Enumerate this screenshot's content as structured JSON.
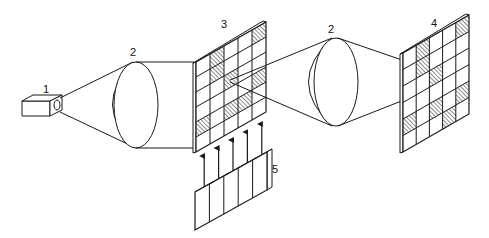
{
  "diagram": {
    "type": "optical-system-schematic",
    "stroke_color": "#1a1a1a",
    "hatch_color": "#1a1a1a",
    "background": "#ffffff",
    "components": [
      {
        "id": "1",
        "label": "1",
        "kind": "light-source"
      },
      {
        "id": "2a",
        "label": "2",
        "kind": "lens"
      },
      {
        "id": "3",
        "label": "3",
        "kind": "grid-mask"
      },
      {
        "id": "2b",
        "label": "2",
        "kind": "lens"
      },
      {
        "id": "4",
        "label": "4",
        "kind": "grid-screen"
      },
      {
        "id": "5",
        "label": "5",
        "kind": "control-block"
      }
    ],
    "grid3": {
      "cols": 5,
      "rows": 6,
      "hatched": [
        [
          1,
          0
        ],
        [
          1,
          1
        ],
        [
          4,
          0
        ],
        [
          2,
          2
        ],
        [
          0,
          4
        ],
        [
          2,
          4
        ],
        [
          3,
          4
        ],
        [
          4,
          3
        ]
      ]
    },
    "grid4": {
      "cols": 5,
      "rows": 6,
      "hatched": [
        [
          1,
          0
        ],
        [
          1,
          1
        ],
        [
          4,
          0
        ],
        [
          2,
          2
        ],
        [
          0,
          4
        ],
        [
          2,
          4
        ],
        [
          3,
          5
        ],
        [
          4,
          4
        ]
      ]
    },
    "block5": {
      "segments": 5,
      "arrows": 5
    }
  }
}
